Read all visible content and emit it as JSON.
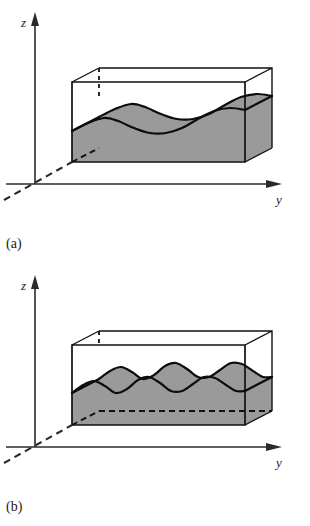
{
  "figure": {
    "background_color": "#ffffff",
    "ink_color": "#111111",
    "shade_color": "#9a9a9a"
  },
  "panels": [
    {
      "id": "a",
      "caption": "(a)",
      "axes": {
        "vertical_label": "z",
        "horizontal_label": "y",
        "depth_axis_style": "dashed",
        "origin": [
          35,
          184
        ]
      },
      "box": {
        "front_left_bottom": [
          72,
          162
        ],
        "front_right_bottom": [
          245,
          162
        ],
        "front_top_left": [
          72,
          82
        ],
        "front_top_right": [
          245,
          82
        ],
        "depth_dx": 27,
        "depth_dy": -14
      },
      "surface": {
        "description": "low-frequency wavy interface",
        "wave_count": 2,
        "front_profile": [
          [
            72,
            131
          ],
          [
            88,
            123
          ],
          [
            104,
            118
          ],
          [
            118,
            121
          ],
          [
            134,
            128
          ],
          [
            150,
            133
          ],
          [
            166,
            133
          ],
          [
            182,
            128
          ],
          [
            198,
            119
          ],
          [
            214,
            111
          ],
          [
            230,
            108
          ],
          [
            245,
            110
          ]
        ],
        "back_profile": [
          [
            99,
            117
          ],
          [
            115,
            109
          ],
          [
            131,
            104
          ],
          [
            145,
            107
          ],
          [
            161,
            114
          ],
          [
            177,
            119
          ],
          [
            193,
            119
          ],
          [
            209,
            114
          ],
          [
            225,
            105
          ],
          [
            241,
            97
          ],
          [
            257,
            94
          ],
          [
            272,
            96
          ]
        ]
      },
      "hidden_edges": [
        "vertical back-left edge",
        "diagonal depth edge"
      ]
    },
    {
      "id": "b",
      "caption": "(b)",
      "axes": {
        "vertical_label": "z",
        "horizontal_label": "y",
        "depth_axis_style": "dashed",
        "origin": [
          35,
          184
        ]
      },
      "box": {
        "front_left_bottom": [
          72,
          162
        ],
        "front_right_bottom": [
          245,
          162
        ],
        "front_top_left": [
          72,
          82
        ],
        "front_top_right": [
          245,
          82
        ],
        "depth_dx": 27,
        "depth_dy": -14
      },
      "surface": {
        "description": "higher-frequency wavy interface",
        "wave_count": 4,
        "front_profile": [
          [
            72,
            130
          ],
          [
            83,
            122
          ],
          [
            94,
            118
          ],
          [
            105,
            123
          ],
          [
            116,
            130
          ],
          [
            127,
            126
          ],
          [
            138,
            117
          ],
          [
            149,
            114
          ],
          [
            160,
            120
          ],
          [
            171,
            128
          ],
          [
            182,
            128
          ],
          [
            193,
            121
          ],
          [
            204,
            114
          ],
          [
            215,
            115
          ],
          [
            226,
            122
          ],
          [
            236,
            128
          ],
          [
            245,
            128
          ]
        ],
        "back_profile": [
          [
            99,
            116
          ],
          [
            110,
            108
          ],
          [
            121,
            104
          ],
          [
            132,
            109
          ],
          [
            143,
            116
          ],
          [
            154,
            112
          ],
          [
            165,
            103
          ],
          [
            176,
            100
          ],
          [
            187,
            106
          ],
          [
            198,
            114
          ],
          [
            209,
            114
          ],
          [
            220,
            107
          ],
          [
            231,
            100
          ],
          [
            242,
            101
          ],
          [
            253,
            108
          ],
          [
            263,
            114
          ],
          [
            272,
            114
          ]
        ]
      },
      "hidden_edges": [
        "short vertical dashed segment at back-left",
        "diagonal depth edge",
        "horizontal back bottom edge"
      ]
    }
  ]
}
